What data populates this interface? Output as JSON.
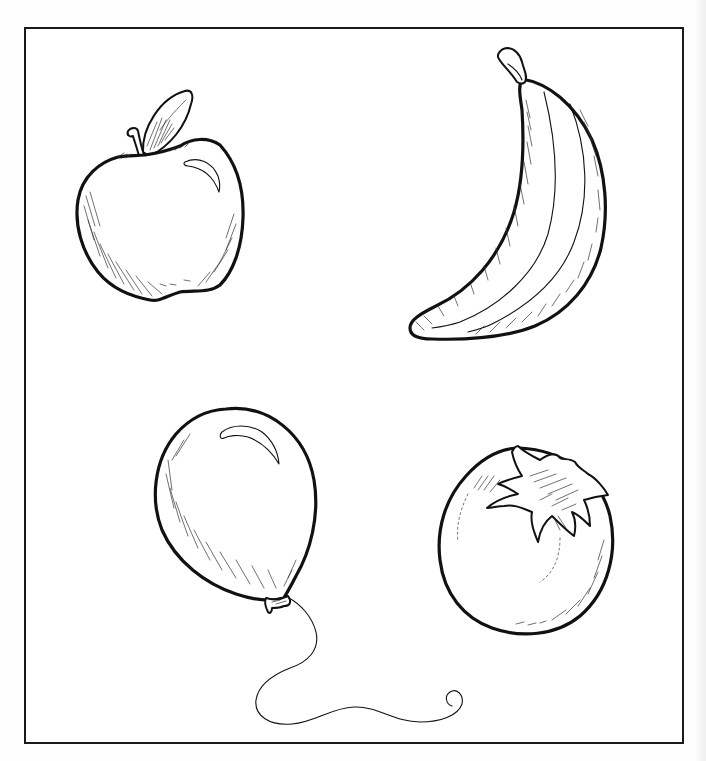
{
  "worksheet": {
    "type": "line-art coloring / picture identification sheet",
    "frame": {
      "stroke_color": "#1a1a1a",
      "background": "#ffffff"
    },
    "items": [
      {
        "name": "apple",
        "position": "top-left",
        "icon": "apple-icon"
      },
      {
        "name": "banana",
        "position": "top-right",
        "icon": "banana-icon"
      },
      {
        "name": "balloon",
        "position": "bottom-left",
        "icon": "balloon-icon"
      },
      {
        "name": "tomato",
        "position": "bottom-right",
        "icon": "tomato-icon"
      }
    ],
    "colors": {
      "ink": "#111111",
      "paper": "#ffffff"
    }
  }
}
